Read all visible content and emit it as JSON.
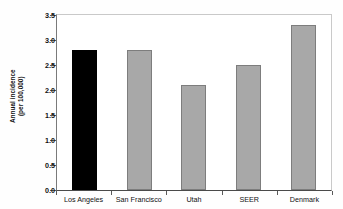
{
  "chart_data": {
    "type": "bar",
    "title": "",
    "xlabel": "",
    "ylabel": "Annual incidence (per 100,000)",
    "ylabel_line1": "Annual incidence",
    "ylabel_line2": "(per 100,000)",
    "categories": [
      "Los Angeles",
      "San Francisco",
      "Utah",
      "SEER",
      "Denmark"
    ],
    "values": [
      2.8,
      2.8,
      2.1,
      2.5,
      3.3
    ],
    "ylim": [
      0.0,
      3.5
    ],
    "ytick_values": [
      0.0,
      0.5,
      1.0,
      1.5,
      2.0,
      2.5,
      3.0,
      3.5
    ],
    "ytick_labels": [
      "0.0",
      "0.5",
      "1.0",
      "1.5",
      "2.0",
      "2.5",
      "3.0",
      "3.5"
    ],
    "grid": false,
    "legend": null,
    "bar_colors": [
      "#000000",
      "#a8a8a8",
      "#a8a8a8",
      "#a8a8a8",
      "#a8a8a8"
    ],
    "bar_edge_color": "#7d7d7d",
    "highlight_category": "Los Angeles",
    "highlight_color": "#000000",
    "series_color": "#a8a8a8"
  }
}
